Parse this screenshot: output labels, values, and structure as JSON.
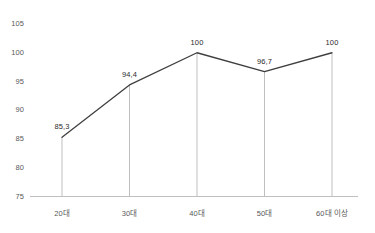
{
  "chart_data": {
    "type": "line",
    "title": "",
    "subtitle": "",
    "xlabel": "",
    "ylabel": "",
    "categories": [
      "20대",
      "30대",
      "40대",
      "50대",
      "60대 이상"
    ],
    "values": [
      85.3,
      94.4,
      100,
      96.7,
      100
    ],
    "point_labels": [
      "85,3",
      "94,4",
      "100",
      "96,7",
      "100"
    ],
    "ylim": [
      75,
      105
    ],
    "yticks": [
      75,
      80,
      85,
      90,
      95,
      100,
      105
    ],
    "ytick_labels": [
      "75",
      "80",
      "85",
      "90",
      "95",
      "100",
      "105"
    ],
    "grid": false,
    "droplines": true,
    "legend": "none",
    "series": [
      {
        "name": "",
        "values": [
          85.3,
          94.4,
          100,
          96.7,
          100
        ]
      }
    ]
  },
  "style": {
    "line_color": "#3f3f3f",
    "axis_color": "#bfbfbf",
    "dropline_color": "#bfbfbf",
    "tick_text_color": "#595959",
    "label_text_color": "#2b2b2b",
    "background": "#ffffff"
  }
}
